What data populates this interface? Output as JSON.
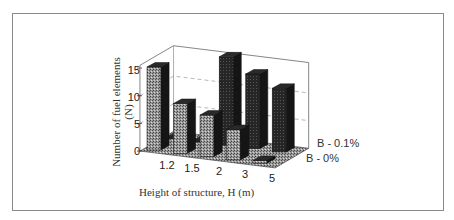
{
  "chart_data": {
    "type": "bar",
    "variant": "3d-grouped",
    "title": "",
    "xlabel": "Height of structure, H (m)",
    "ylabel": "Number of fuel elements (N)",
    "ylim": [
      0,
      15
    ],
    "yticks": [
      "0",
      "5",
      "10",
      "15"
    ],
    "categories": [
      "1.2",
      "1.5",
      "2",
      "3",
      "5"
    ],
    "series": [
      {
        "name": "B - 0%",
        "values": [
          15,
          9,
          7.5,
          5.5,
          0.5
        ],
        "pattern": "stippled-gray"
      },
      {
        "name": "B - 0.1%",
        "values": [
          0,
          0,
          16,
          13.5,
          11.5
        ],
        "pattern": "dark"
      }
    ],
    "legend_position": "right (depth-axis labels)",
    "grid": true
  },
  "labels": {
    "ylabel_line1": "Number of fuel elements",
    "ylabel_line2": "(N)",
    "xlabel": "Height of structure, H (m)",
    "depth_back": "B - 0.1%",
    "depth_front": "B - 0%"
  }
}
